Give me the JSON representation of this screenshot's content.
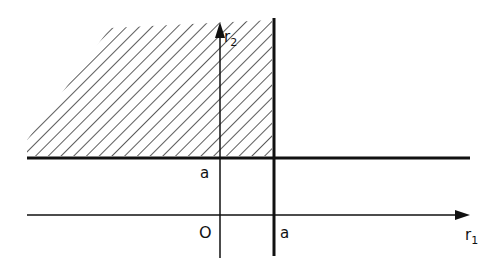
{
  "diagram": {
    "axes": {
      "x_label": "r",
      "x_label_sub": "1",
      "y_label": "r",
      "y_label_sub": "2",
      "origin_label": "O"
    },
    "ticks": {
      "x_a_label": "a",
      "y_a_label": "a"
    },
    "region": {
      "description": "hatched region r1 < a, r2 > a",
      "fill_pattern": "diagonal-hatch"
    },
    "colors": {
      "ink": "#111111",
      "background": "#ffffff"
    }
  }
}
